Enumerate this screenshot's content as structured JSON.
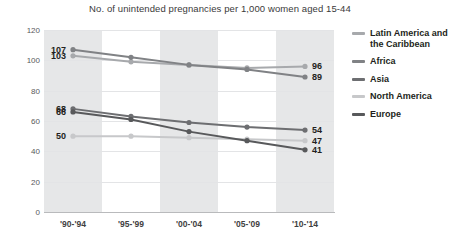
{
  "chart_data": {
    "type": "line",
    "title": "No. of unintended pregnancies per 1,000 women aged 15-44",
    "xlabel": "",
    "ylabel": "",
    "ylim": [
      0,
      120
    ],
    "ytick_labels": [
      "0",
      "20",
      "40",
      "60",
      "80",
      "100",
      "120"
    ],
    "ytick_values": [
      0,
      20,
      40,
      60,
      80,
      100,
      120
    ],
    "grid": true,
    "legend_position": "right",
    "categories": [
      "'90-'94",
      "'95-'99",
      "'00-'04",
      "'05-'09",
      "'10-'14"
    ],
    "series": [
      {
        "name": "Latin America and the Caribbean",
        "legend_label_line1": "Latin America and",
        "legend_label_line2": "the Caribbean",
        "color": "#a7a9ac",
        "values": [
          103,
          99,
          97,
          95,
          96
        ],
        "start_label": "103",
        "end_label": "96"
      },
      {
        "name": "Africa",
        "legend_label_line1": "Africa",
        "legend_label_line2": "",
        "color": "#808285",
        "values": [
          107,
          102,
          97,
          94,
          89
        ],
        "start_label": "107",
        "end_label": "89"
      },
      {
        "name": "Asia",
        "legend_label_line1": "Asia",
        "legend_label_line2": "",
        "color": "#6d6e71",
        "values": [
          68,
          63,
          59,
          56,
          54
        ],
        "start_label": "68",
        "end_label": "54"
      },
      {
        "name": "North America",
        "legend_label_line1": "North America",
        "legend_label_line2": "",
        "color": "#c7c8ca",
        "values": [
          50,
          50,
          49,
          48,
          47
        ],
        "start_label": "50",
        "end_label": "47"
      },
      {
        "name": "Europe",
        "legend_label_line1": "Europe",
        "legend_label_line2": "",
        "color": "#58595b",
        "values": [
          66,
          61,
          53,
          47,
          41
        ],
        "start_label": "66",
        "end_label": "41"
      }
    ],
    "band_indices": [
      0,
      2,
      4
    ],
    "band_color": "#e6e7e8"
  }
}
